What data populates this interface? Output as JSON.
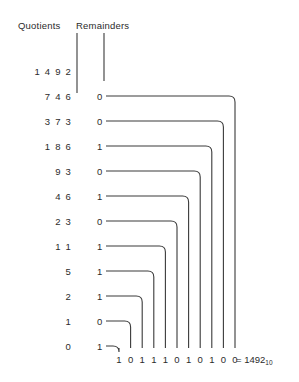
{
  "headers": {
    "quotients": "Quotients",
    "remainders": "Remainders"
  },
  "chart_data": {
    "type": "diagram",
    "columns": [
      "Quotients",
      "Remainders"
    ],
    "rows": [
      {
        "quotient": "1 4 9 2",
        "remainder": ""
      },
      {
        "quotient": "7 4 6",
        "remainder": "0"
      },
      {
        "quotient": "3 7 3",
        "remainder": "0"
      },
      {
        "quotient": "1 8 6",
        "remainder": "1"
      },
      {
        "quotient": "9 3",
        "remainder": "0"
      },
      {
        "quotient": "4 6",
        "remainder": "1"
      },
      {
        "quotient": "2 3",
        "remainder": "0"
      },
      {
        "quotient": "1 1",
        "remainder": "1"
      },
      {
        "quotient": "5",
        "remainder": "1"
      },
      {
        "quotient": "2",
        "remainder": "1"
      },
      {
        "quotient": "1",
        "remainder": "0"
      },
      {
        "quotient": "0",
        "remainder": "1"
      }
    ],
    "result_bits": [
      "1",
      "0",
      "1",
      "1",
      "1",
      "0",
      "1",
      "0",
      "1",
      "0",
      "0"
    ],
    "result_equals": "=",
    "result_value": "1492",
    "result_subscript": "10",
    "line_color": "#3a3a3a",
    "text_color": "#2b2b2b",
    "background": "#ffffff"
  },
  "icons": {
    "quotients_arrow": "down-arrow-icon",
    "remainders_arrow": "down-arrow-icon",
    "bit_arrow": "down-arrow-icon"
  }
}
